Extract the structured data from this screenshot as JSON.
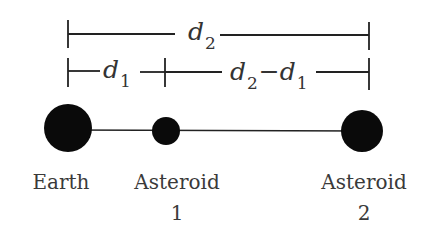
{
  "diagram": {
    "title": "",
    "dimensions": {
      "top": {
        "symbol": "d",
        "subscript": "2"
      },
      "left": {
        "symbol": "d",
        "subscript": "1"
      },
      "right": {
        "symbol_a": "d",
        "subscript_a": "2",
        "operator": "−",
        "symbol_b": "d",
        "subscript_b": "1"
      }
    },
    "bodies": [
      {
        "id": "earth",
        "label_line1": "Earth",
        "label_line2": "",
        "cx": 68,
        "cy": 128,
        "r": 24
      },
      {
        "id": "asteroid-1",
        "label_line1": "Asteroid",
        "label_line2": "1",
        "cx": 166,
        "cy": 131,
        "r": 14
      },
      {
        "id": "asteroid-2",
        "label_line1": "Asteroid",
        "label_line2": "2",
        "cx": 362,
        "cy": 131,
        "r": 21
      }
    ],
    "colors": {
      "body_fill": "#0a0a0a",
      "line": "#222222",
      "text": "#333333"
    }
  }
}
